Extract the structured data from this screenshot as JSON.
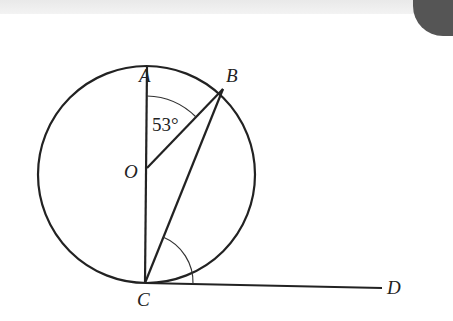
{
  "diagram": {
    "type": "circle-geometry",
    "points": {
      "A": {
        "label": "A",
        "x": 147,
        "y": 66
      },
      "B": {
        "label": "B",
        "x": 223,
        "y": 89
      },
      "O": {
        "label": "O",
        "x": 147,
        "y": 172
      },
      "C": {
        "label": "C",
        "x": 145,
        "y": 283
      },
      "D": {
        "label": "D",
        "x": 382,
        "y": 288
      }
    },
    "circle": {
      "center": "O",
      "cx": 146.5,
      "cy": 174.5,
      "r": 108.5
    },
    "segments": [
      "AC",
      "OB",
      "BC",
      "CD"
    ],
    "angles": [
      {
        "at": "O",
        "between": [
          "OA",
          "OB"
        ],
        "label": "53°"
      },
      {
        "at": "C",
        "between": [
          "CB",
          "CD"
        ],
        "label": ""
      }
    ],
    "line_color": "#222222"
  },
  "labels": {
    "A": "A",
    "B": "B",
    "O": "O",
    "C": "C",
    "D": "D",
    "angle_AOB": "53°"
  }
}
